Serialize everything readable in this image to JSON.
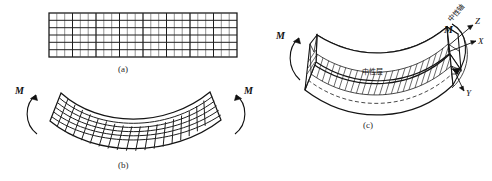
{
  "figure": {
    "title_visible": false,
    "background_color": "#ffffff",
    "ink_color": "#141414",
    "panels": [
      {
        "id": "a",
        "caption": "(a)",
        "description": "undeformed straight beam with rectangular grid",
        "grid_columns": 24,
        "grid_rows": 6
      },
      {
        "id": "b",
        "caption": "(b)",
        "description": "beam in pure bending, grid deformed, moments applied at both ends",
        "grid_columns": 24,
        "grid_rows": 6,
        "moment_left": "M",
        "moment_right": "M"
      },
      {
        "id": "c",
        "caption": "(c)",
        "description": "three dimensional view of bent beam showing neutral layer and neutral axis",
        "moment_left": "M",
        "moment_right": "M",
        "neutral_layer_label": "中性层",
        "neutral_axis_label": "中性轴",
        "axes": [
          {
            "name": "Z",
            "label": "Z"
          },
          {
            "name": "X",
            "label": "X"
          },
          {
            "name": "Y",
            "label": "Y"
          }
        ]
      }
    ]
  },
  "labels": {
    "caption_a": "(a)",
    "caption_b": "(b)",
    "caption_c": "(c)",
    "moment_b_left": "M",
    "moment_b_right": "M",
    "moment_c_left": "M",
    "moment_c_right": "M",
    "axis_z": "Z",
    "axis_x": "X",
    "axis_y": "Y",
    "neutral_layer": "中性层",
    "neutral_axis": "中性轴"
  }
}
